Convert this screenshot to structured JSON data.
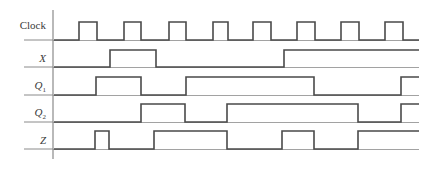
{
  "diagram": {
    "type": "timing-diagram",
    "colors": {
      "line": "#4a4a4a",
      "grid": "#8a8a8a",
      "text": "#3a3a3a",
      "background": "#ffffff"
    },
    "axis": {
      "x": 53,
      "y_top": 10,
      "y_bottom": 159
    },
    "row_line_start_x": 24,
    "end_x": 419,
    "signals": [
      {
        "name": "Clock",
        "label": "Clock",
        "italic": false,
        "sub": "",
        "baseline_y": 40,
        "high_y": 22,
        "label_y": 19,
        "edges": [
          54,
          79,
          97,
          124,
          141,
          169,
          186,
          213,
          228,
          253,
          271,
          297,
          315,
          341,
          359,
          385,
          403
        ],
        "initial": 0
      },
      {
        "name": "X",
        "label": "X",
        "italic": true,
        "sub": "",
        "baseline_y": 67,
        "high_y": 50,
        "label_y": 52,
        "edges": [
          54,
          110,
          156,
          284
        ],
        "initial": 0
      },
      {
        "name": "Q1",
        "label": "Q",
        "italic": true,
        "sub": "1",
        "baseline_y": 95,
        "high_y": 77,
        "label_y": 79,
        "edges": [
          54,
          96,
          141,
          186,
          314,
          401
        ],
        "initial": 0
      },
      {
        "name": "Q2",
        "label": "Q",
        "italic": true,
        "sub": "2",
        "baseline_y": 122,
        "high_y": 104,
        "label_y": 106,
        "edges": [
          54,
          141,
          185,
          227,
          358,
          401
        ],
        "initial": 0
      },
      {
        "name": "Z",
        "label": "Z",
        "italic": true,
        "sub": "",
        "baseline_y": 149,
        "high_y": 131,
        "label_y": 134,
        "edges": [
          54,
          95,
          109,
          154,
          227,
          282,
          314,
          358
        ],
        "initial": 0
      }
    ]
  }
}
